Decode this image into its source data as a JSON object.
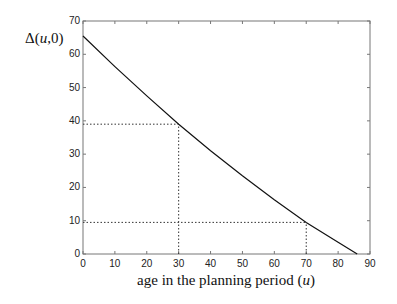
{
  "chart_data": {
    "type": "line",
    "title": "",
    "xlabel": "age in the planning period (u)",
    "ylabel": "Δ(u,0)",
    "xlim": [
      0,
      90
    ],
    "ylim": [
      0,
      70
    ],
    "xticks": [
      0,
      10,
      20,
      30,
      40,
      50,
      60,
      70,
      80,
      90
    ],
    "yticks": [
      0,
      10,
      20,
      30,
      40,
      50,
      60,
      70
    ],
    "grid": false,
    "legend": null,
    "series": [
      {
        "name": "Δ(u,0)",
        "style": "solid",
        "x": [
          0,
          10,
          20,
          30,
          40,
          50,
          60,
          70,
          80,
          86
        ],
        "y": [
          65.5,
          56.3,
          47.5,
          39.0,
          31.0,
          23.5,
          16.3,
          9.5,
          3.5,
          0
        ]
      }
    ],
    "annotations": [
      {
        "type": "dotted-reference",
        "x": 30,
        "y": 39,
        "note": "vertical from x-axis to curve and horizontal from y-axis to curve"
      },
      {
        "type": "dotted-reference",
        "x": 70,
        "y": 9.5,
        "note": "vertical from x-axis to curve and horizontal from y-axis to curve"
      }
    ]
  },
  "labels": {
    "y_prefix": "Δ(",
    "y_var": "u",
    "y_suffix": ",0)",
    "x_prefix": "age in the planning period (",
    "x_var": "u",
    "x_suffix": ")"
  }
}
